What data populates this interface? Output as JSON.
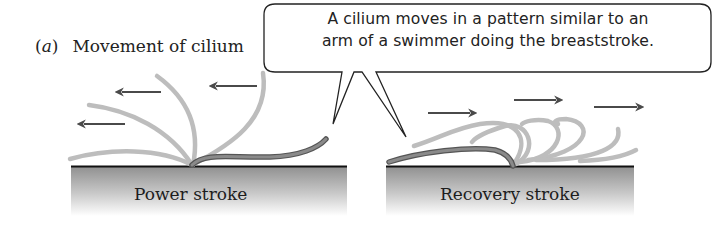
{
  "figure": {
    "panel_letter": "a",
    "panel_title": "Movement of cilium",
    "callout": {
      "line1": "A cilium moves in a pattern similar to an",
      "line2": "arm of a swimmer doing the breaststroke."
    },
    "left_panel": {
      "label": "Power stroke",
      "arrow_direction": "left",
      "arrow_count": 3
    },
    "right_panel": {
      "label": "Recovery stroke",
      "arrow_direction": "right",
      "arrow_count": 3
    },
    "colors": {
      "active_cilium": "#7a7a7a",
      "ghost_cilium": "#bdbdbd",
      "arrow": "#4a4a4a",
      "surface_top_line": "#111111",
      "surface_gradient_top": "#8f8f8f",
      "surface_gradient_bottom": "#ffffff",
      "callout_border": "#222222"
    }
  }
}
